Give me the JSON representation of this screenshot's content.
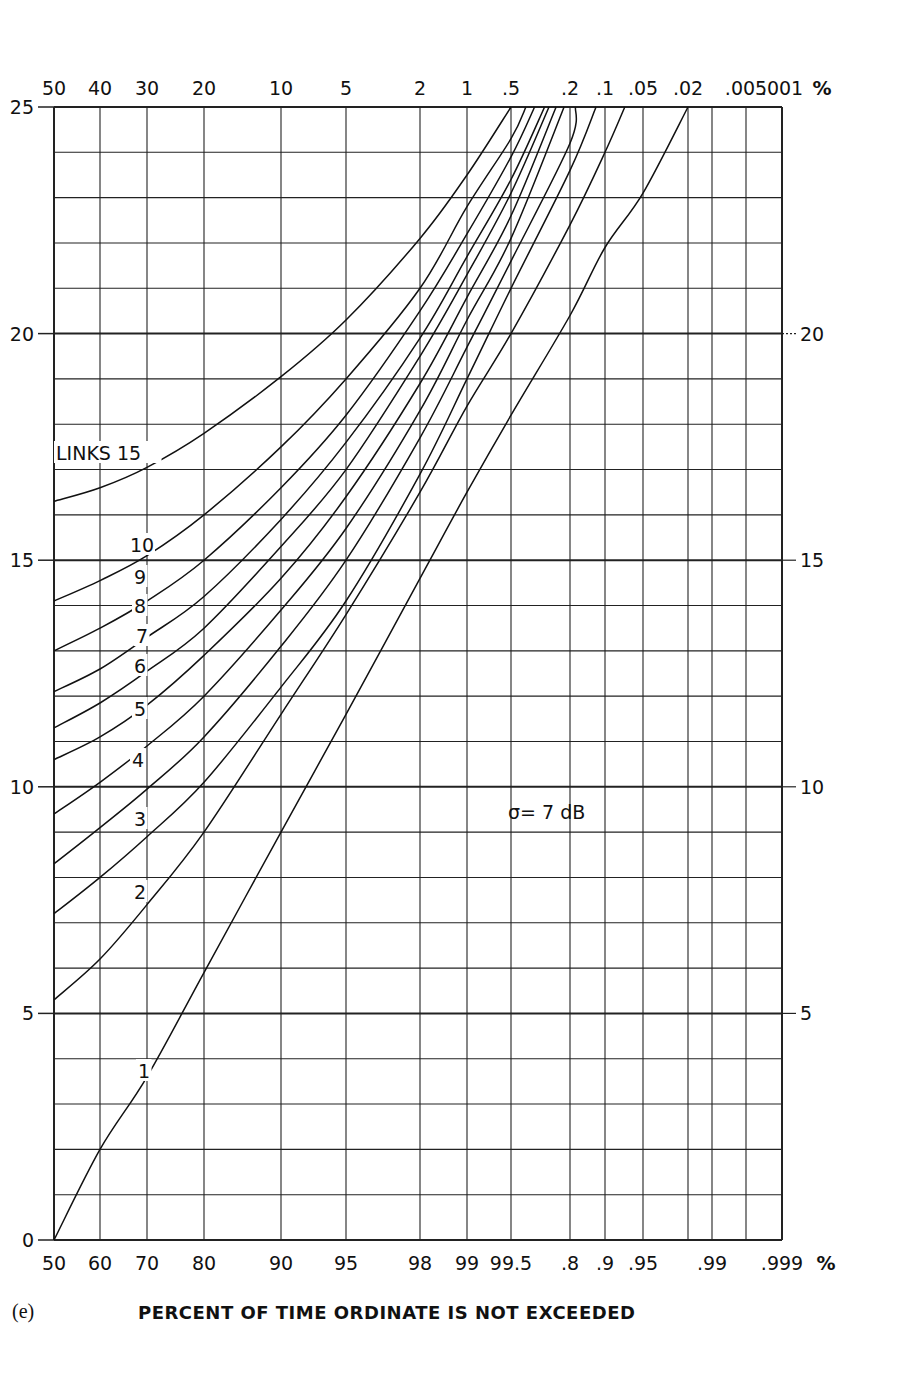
{
  "chart_data": {
    "type": "line",
    "title": "",
    "panel_tag": "(e)",
    "xlabel": "PERCENT OF TIME ORDINATE IS NOT EXCEEDED",
    "ylabel": "",
    "annotation": "σ= 7 dB",
    "legend_title": "LINKS",
    "ylim": [
      0,
      25
    ],
    "y_ticks_left": [
      "0",
      "5",
      "10",
      "15",
      "20",
      "25"
    ],
    "y_ticks_right": [
      "5",
      "10",
      "15",
      "20"
    ],
    "x_scale": "normal probability",
    "x_bottom_ticks": [
      {
        "label": "50",
        "pct": 50,
        "px": 54
      },
      {
        "label": "60",
        "pct": 60,
        "px": 100
      },
      {
        "label": "70",
        "pct": 70,
        "px": 147
      },
      {
        "label": "80",
        "pct": 80,
        "px": 204
      },
      {
        "label": "90",
        "pct": 90,
        "px": 281
      },
      {
        "label": "95",
        "pct": 95,
        "px": 346
      },
      {
        "label": "98",
        "pct": 98,
        "px": 420
      },
      {
        "label": "99",
        "pct": 99,
        "px": 467
      },
      {
        "label": "99.5",
        "pct": 99.5,
        "px": 511
      },
      {
        "label": ".8",
        "pct": 99.8,
        "px": 570
      },
      {
        "label": ".9",
        "pct": 99.9,
        "px": 605
      },
      {
        "label": ".95",
        "pct": 99.95,
        "px": 643
      },
      {
        "label": "",
        "pct": 99.98,
        "px": 688
      },
      {
        "label": ".99",
        "pct": 99.99,
        "px": 712
      },
      {
        "label": "",
        "pct": 99.995,
        "px": 746
      },
      {
        "label": ".999",
        "pct": 99.999,
        "px": 782
      }
    ],
    "x_bottom_unit": "%",
    "x_top_ticks": [
      {
        "label": "50",
        "px": 54
      },
      {
        "label": "40",
        "px": 100
      },
      {
        "label": "30",
        "px": 147
      },
      {
        "label": "20",
        "px": 204
      },
      {
        "label": "10",
        "px": 281
      },
      {
        "label": "5",
        "px": 346
      },
      {
        "label": "2",
        "px": 420
      },
      {
        "label": "1",
        "px": 467
      },
      {
        "label": ".5",
        "px": 511
      },
      {
        "label": ".2",
        "px": 570
      },
      {
        "label": ".1",
        "px": 605
      },
      {
        "label": ".05",
        "px": 643
      },
      {
        "label": ".02",
        "px": 688
      },
      {
        "label": ".005",
        "px": 746
      },
      {
        "label": ".001",
        "px": 782
      }
    ],
    "x_top_unit": "%",
    "grid": true,
    "series": [
      {
        "name": "15",
        "points": [
          [
            50,
            16.3
          ],
          [
            60,
            16.6
          ],
          [
            70,
            17.05
          ],
          [
            80,
            17.8
          ],
          [
            90,
            19.05
          ],
          [
            95,
            20.3
          ],
          [
            98,
            22.1
          ],
          [
            99,
            23.5
          ],
          [
            99.5,
            25.0
          ]
        ]
      },
      {
        "name": "10",
        "points": [
          [
            50,
            14.1
          ],
          [
            60,
            14.55
          ],
          [
            70,
            15.1
          ],
          [
            80,
            16.0
          ],
          [
            90,
            17.5
          ],
          [
            95,
            19.0
          ],
          [
            98,
            21.0
          ],
          [
            99,
            22.8
          ],
          [
            99.5,
            24.3
          ],
          [
            99.6,
            25.0
          ]
        ]
      },
      {
        "name": "9",
        "points": [
          [
            50,
            13.0
          ],
          [
            60,
            13.5
          ],
          [
            70,
            14.1
          ],
          [
            80,
            15.0
          ],
          [
            90,
            16.6
          ],
          [
            95,
            18.2
          ],
          [
            98,
            20.5
          ],
          [
            99,
            22.2
          ],
          [
            99.5,
            23.9
          ],
          [
            99.65,
            25.0
          ]
        ]
      },
      {
        "name": "8",
        "points": [
          [
            50,
            12.1
          ],
          [
            60,
            12.6
          ],
          [
            70,
            13.3
          ],
          [
            80,
            14.2
          ],
          [
            90,
            15.9
          ],
          [
            95,
            17.6
          ],
          [
            98,
            19.9
          ],
          [
            99,
            21.7
          ],
          [
            99.5,
            23.4
          ],
          [
            99.7,
            25.0
          ]
        ]
      },
      {
        "name": "7",
        "points": [
          [
            50,
            11.3
          ],
          [
            60,
            11.85
          ],
          [
            70,
            12.55
          ],
          [
            80,
            13.5
          ],
          [
            90,
            15.3
          ],
          [
            95,
            17.0
          ],
          [
            98,
            19.5
          ],
          [
            99,
            21.3
          ],
          [
            99.5,
            23.1
          ],
          [
            99.72,
            25.0
          ]
        ]
      },
      {
        "name": "6",
        "points": [
          [
            50,
            10.6
          ],
          [
            60,
            11.1
          ],
          [
            70,
            11.8
          ],
          [
            80,
            12.9
          ],
          [
            90,
            14.6
          ],
          [
            95,
            16.4
          ],
          [
            98,
            18.9
          ],
          [
            99,
            20.8
          ],
          [
            99.5,
            22.6
          ],
          [
            99.75,
            25.0
          ]
        ]
      },
      {
        "name": "5",
        "points": [
          [
            50,
            9.4
          ],
          [
            60,
            10.1
          ],
          [
            70,
            10.9
          ],
          [
            80,
            12.0
          ],
          [
            90,
            13.9
          ],
          [
            95,
            15.7
          ],
          [
            98,
            18.3
          ],
          [
            99,
            20.3
          ],
          [
            99.5,
            22.1
          ],
          [
            99.78,
            25.0
          ]
        ]
      },
      {
        "name": "4",
        "points": [
          [
            50,
            8.3
          ],
          [
            60,
            9.1
          ],
          [
            70,
            9.95
          ],
          [
            80,
            11.1
          ],
          [
            90,
            13.1
          ],
          [
            95,
            15.0
          ],
          [
            98,
            17.7
          ],
          [
            99,
            19.7
          ],
          [
            99.5,
            21.6
          ],
          [
            99.8,
            24.2
          ],
          [
            99.82,
            25.0
          ]
        ]
      },
      {
        "name": "3",
        "points": [
          [
            50,
            7.2
          ],
          [
            60,
            8.0
          ],
          [
            70,
            8.9
          ],
          [
            80,
            10.1
          ],
          [
            90,
            12.2
          ],
          [
            95,
            14.1
          ],
          [
            98,
            16.9
          ],
          [
            99,
            19.0
          ],
          [
            99.5,
            21.0
          ],
          [
            99.8,
            23.6
          ],
          [
            99.88,
            25.0
          ]
        ]
      },
      {
        "name": "2",
        "points": [
          [
            50,
            5.3
          ],
          [
            60,
            6.2
          ],
          [
            70,
            7.4
          ],
          [
            80,
            9.0
          ],
          [
            90,
            11.6
          ],
          [
            95,
            13.8
          ],
          [
            98,
            16.5
          ],
          [
            99,
            18.4
          ],
          [
            99.5,
            20.0
          ],
          [
            99.8,
            22.4
          ],
          [
            99.9,
            24.0
          ],
          [
            99.93,
            25.0
          ]
        ]
      },
      {
        "name": "1",
        "points": [
          [
            50,
            0.0
          ],
          [
            60,
            2.0
          ],
          [
            70,
            3.6
          ],
          [
            80,
            5.9
          ],
          [
            90,
            9.0
          ],
          [
            95,
            11.6
          ],
          [
            98,
            14.6
          ],
          [
            99,
            16.5
          ],
          [
            99.5,
            18.2
          ],
          [
            99.8,
            20.4
          ],
          [
            99.9,
            21.9
          ],
          [
            99.95,
            23.1
          ],
          [
            99.98,
            25.0
          ]
        ]
      }
    ],
    "curve_labels": [
      {
        "text": "LINKS  15",
        "x": 56,
        "y": 460
      },
      {
        "text": "10",
        "x": 130,
        "y": 552
      },
      {
        "text": "9",
        "x": 134,
        "y": 584
      },
      {
        "text": "8",
        "x": 134,
        "y": 613
      },
      {
        "text": "7",
        "x": 136,
        "y": 643
      },
      {
        "text": "6",
        "x": 134,
        "y": 673
      },
      {
        "text": "5",
        "x": 134,
        "y": 716
      },
      {
        "text": "4",
        "x": 132,
        "y": 767
      },
      {
        "text": "3",
        "x": 134,
        "y": 826
      },
      {
        "text": "2",
        "x": 134,
        "y": 899
      },
      {
        "text": "1",
        "x": 138,
        "y": 1078
      }
    ],
    "annotation_pos": {
      "x": 508,
      "y": 819
    },
    "colors": {
      "line": "#111111",
      "grid": "#222222",
      "background": "#ffffff"
    }
  }
}
